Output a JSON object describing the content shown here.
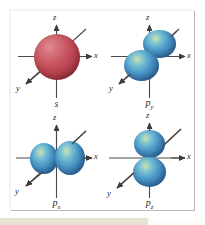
{
  "figure": {
    "background_color": "#ffffff",
    "frame_color": "#b9b9b9",
    "bottom_strip_color": "#e8e2d4"
  },
  "colors": {
    "s_orbital": "#b33f4c",
    "p_orbital": "#3b7fb4",
    "axis": "#4a4a4a",
    "label": "#2a2a2a"
  },
  "axes": {
    "z_label": "z",
    "x_label": "x",
    "y_label": "y"
  },
  "panels": [
    {
      "id": "s",
      "label": "s",
      "label_base": "s",
      "label_sub": "",
      "orbital_type": "sphere",
      "color": "#b33f4c",
      "lobe_count": 1,
      "orientation": "spherical",
      "axis_labels": {
        "z": "z",
        "x": "x",
        "y": "y"
      }
    },
    {
      "id": "py",
      "label": "py",
      "label_base": "p",
      "label_sub": "y",
      "orbital_type": "dumbbell",
      "color": "#3b7fb4",
      "lobe_count": 2,
      "orientation": "along-y-axis",
      "axis_labels": {
        "z": "z",
        "x": "x",
        "y": "y"
      }
    },
    {
      "id": "px",
      "label": "px",
      "label_base": "p",
      "label_sub": "x",
      "orbital_type": "dumbbell",
      "color": "#3b7fb4",
      "lobe_count": 2,
      "orientation": "along-x-axis",
      "axis_labels": {
        "z": "z",
        "x": "x",
        "y": "y"
      }
    },
    {
      "id": "pz",
      "label": "pz",
      "label_base": "p",
      "label_sub": "z",
      "orbital_type": "dumbbell",
      "color": "#3b7fb4",
      "lobe_count": 2,
      "orientation": "along-z-axis",
      "axis_labels": {
        "z": "z",
        "x": "x",
        "y": "y"
      }
    }
  ]
}
